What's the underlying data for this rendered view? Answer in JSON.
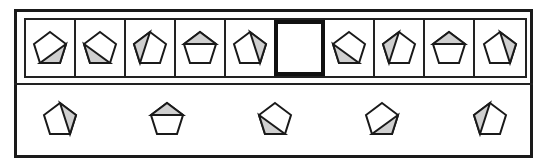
{
  "puzzle": {
    "type": "pentagon-sequence",
    "missing_index": 5,
    "colors": {
      "stroke": "#1a1a1a",
      "shade": "#cfcfcf",
      "background": "#ffffff"
    },
    "sequence": [
      {
        "id": 1,
        "shaded": "bottom-right"
      },
      {
        "id": 2,
        "shaded": "bottom-left"
      },
      {
        "id": 3,
        "shaded": "left-top"
      },
      {
        "id": 4,
        "shaded": "top"
      },
      {
        "id": 5,
        "shaded": "right-top"
      },
      {
        "id": 6,
        "shaded": "missing"
      },
      {
        "id": 7,
        "shaded": "bottom-left"
      },
      {
        "id": 8,
        "shaded": "left-top"
      },
      {
        "id": 9,
        "shaded": "top"
      },
      {
        "id": 10,
        "shaded": "right-top"
      }
    ],
    "options": [
      {
        "id": 1,
        "shaded": "right-top"
      },
      {
        "id": 2,
        "shaded": "top"
      },
      {
        "id": 3,
        "shaded": "bottom-left"
      },
      {
        "id": 4,
        "shaded": "bottom-right"
      },
      {
        "id": 5,
        "shaded": "left-top"
      }
    ]
  }
}
